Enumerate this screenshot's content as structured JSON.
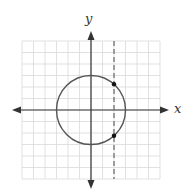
{
  "diagram": {
    "type": "coordinate-plane",
    "axes": {
      "x_label": "x",
      "y_label": "y"
    },
    "grid": {
      "x_min": -6,
      "x_max": 6,
      "y_min": -6,
      "y_max": 6,
      "step": 1
    },
    "circle": {
      "center": [
        0,
        0
      ],
      "radius": 3
    },
    "vertical_line": {
      "x": 2,
      "style": "dashed"
    },
    "points": [
      {
        "x": 2,
        "y": 2.236
      },
      {
        "x": 2,
        "y": -2.236
      }
    ],
    "colors": {
      "grid": "#d9d9d9",
      "axes": "#333333",
      "circle": "#555555",
      "dashed_line": "#666666",
      "points": "#111111"
    }
  }
}
